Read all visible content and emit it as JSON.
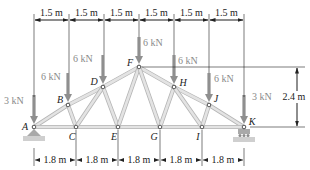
{
  "figure": {
    "colors": {
      "member_fill": "#e3e3e3",
      "member_edge": "#b5b5b5",
      "load_arrow": "#8f8f8f",
      "dimension": "#222222",
      "support": "#a9a9a9",
      "background": "#ffffff"
    },
    "joints": [
      {
        "id": "A",
        "label": "A",
        "x": 34,
        "y": 127
      },
      {
        "id": "B",
        "label": "B",
        "x": 68,
        "y": 105
      },
      {
        "id": "C",
        "label": "C",
        "x": 76,
        "y": 127
      },
      {
        "id": "D",
        "label": "D",
        "x": 103,
        "y": 87
      },
      {
        "id": "E",
        "label": "E",
        "x": 118,
        "y": 127
      },
      {
        "id": "F",
        "label": "F",
        "x": 139,
        "y": 67
      },
      {
        "id": "G",
        "label": "G",
        "x": 160,
        "y": 127
      },
      {
        "id": "H",
        "label": "H",
        "x": 174,
        "y": 87
      },
      {
        "id": "I",
        "label": "I",
        "x": 202,
        "y": 127
      },
      {
        "id": "J",
        "label": "J",
        "x": 209,
        "y": 105
      },
      {
        "id": "K",
        "label": "K",
        "x": 244,
        "y": 127
      }
    ],
    "members": [
      [
        "A",
        "B"
      ],
      [
        "B",
        "D"
      ],
      [
        "D",
        "F"
      ],
      [
        "F",
        "H"
      ],
      [
        "H",
        "J"
      ],
      [
        "J",
        "K"
      ],
      [
        "A",
        "C"
      ],
      [
        "C",
        "E"
      ],
      [
        "E",
        "G"
      ],
      [
        "G",
        "I"
      ],
      [
        "I",
        "K"
      ],
      [
        "B",
        "C"
      ],
      [
        "C",
        "D"
      ],
      [
        "D",
        "E"
      ],
      [
        "E",
        "F"
      ],
      [
        "F",
        "G"
      ],
      [
        "G",
        "H"
      ],
      [
        "H",
        "I"
      ],
      [
        "I",
        "J"
      ]
    ],
    "loads": [
      {
        "joint": "A",
        "label": "3 kN"
      },
      {
        "joint": "B",
        "label": "6 kN"
      },
      {
        "joint": "D",
        "label": "6 kN"
      },
      {
        "joint": "F",
        "label": "6 kN"
      },
      {
        "joint": "H",
        "label": "6 kN"
      },
      {
        "joint": "J",
        "label": "6 kN"
      },
      {
        "joint": "K",
        "label": "3 kN"
      }
    ],
    "top_dimensions": [
      "1.5 m",
      "1.5 m",
      "1.5 m",
      "1.5 m",
      "1.5 m",
      "1.5 m"
    ],
    "bottom_dimensions": [
      "1.8 m",
      "1.8 m",
      "1.8 m",
      "1.8 m",
      "1.8 m"
    ],
    "height_dimension": "2.4 m",
    "supports": [
      {
        "joint": "A",
        "type": "pin"
      },
      {
        "joint": "K",
        "type": "roller"
      }
    ]
  }
}
